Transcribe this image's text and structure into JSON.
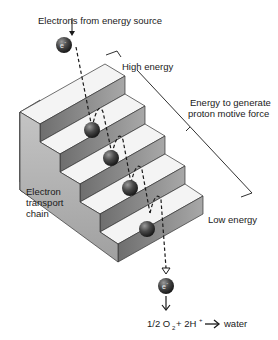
{
  "diagram": {
    "labels": {
      "source": "Electrons from energy source",
      "high": "High energy",
      "force_line1": "Energy to generate",
      "force_line2": "proton motive force",
      "low": "Low energy",
      "chain_line1": "Electron",
      "chain_line2": "transport",
      "chain_line3": "chain",
      "electron": "e",
      "electron_charge": "-",
      "eq_part1": "1/2 O",
      "eq_sub": "2",
      "eq_part2": " + 2H",
      "eq_sup": "+",
      "eq_product": "water"
    },
    "steps": 5,
    "colors": {
      "step_top": "#f4f4f4",
      "step_riser": "#8a8a8a",
      "step_side": "#b0b0b0",
      "ball": "#3a3a3a",
      "line": "#1a1a1a"
    }
  }
}
